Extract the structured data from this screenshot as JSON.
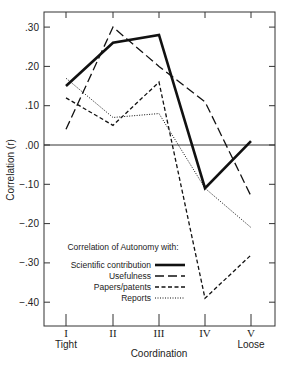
{
  "chart_data": {
    "type": "line",
    "title": "",
    "xlabel": "Coordination",
    "ylabel": "Correlation (r)",
    "categories": [
      "I",
      "II",
      "III",
      "IV",
      "V"
    ],
    "category_sublabels": [
      "Tight",
      "",
      "",
      "",
      "Loose"
    ],
    "yticks": [
      ".30",
      ".20",
      ".10",
      ".00",
      "−.10",
      "−.20",
      "−.30",
      "−.40"
    ],
    "ytick_values": [
      0.3,
      0.2,
      0.1,
      0.0,
      -0.1,
      -0.2,
      -0.3,
      -0.4
    ],
    "ylim": [
      -0.45,
      0.34
    ],
    "grid": false,
    "zero_line": true,
    "legend_title": "Correlation of Autonomy with:",
    "legend_position": "lower-center",
    "series": [
      {
        "name": "Scientific contribution",
        "style": "thick-solid",
        "values": [
          0.15,
          0.26,
          0.28,
          -0.11,
          0.01
        ]
      },
      {
        "name": "Usefulness",
        "style": "long-dash",
        "values": [
          0.04,
          0.3,
          0.2,
          0.11,
          -0.13
        ]
      },
      {
        "name": "Papers/patents",
        "style": "short-dash",
        "values": [
          0.12,
          0.05,
          0.16,
          -0.39,
          -0.28
        ]
      },
      {
        "name": "Reports",
        "style": "dotted",
        "values": [
          0.17,
          0.07,
          0.08,
          -0.11,
          -0.21
        ]
      }
    ]
  }
}
